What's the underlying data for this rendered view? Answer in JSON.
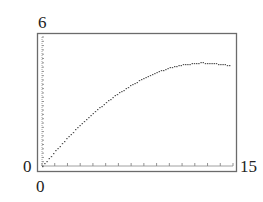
{
  "chart_data": {
    "type": "line",
    "title": "",
    "xlabel": "",
    "ylabel": "",
    "xlim": [
      0,
      15
    ],
    "ylim": [
      0,
      6
    ],
    "grid": false,
    "tick_labels": {
      "y_top": "6",
      "y_bottom": "0",
      "x_left": "0",
      "x_right": "15"
    },
    "x_ticks_count": 15,
    "y_ticks_count": 30,
    "series": [
      {
        "name": "curve",
        "style": "dotted-steps",
        "x": [
          0,
          0.5,
          1,
          1.5,
          2,
          2.5,
          3,
          3.5,
          4,
          4.5,
          5,
          5.5,
          6,
          6.5,
          7,
          7.5,
          8,
          8.5,
          9,
          9.5,
          10,
          10.5,
          11,
          11.5,
          12,
          12.5,
          13,
          13.5,
          14,
          14.5,
          15
        ],
        "values": [
          0,
          0.35,
          0.7,
          1.03,
          1.35,
          1.65,
          1.95,
          2.22,
          2.48,
          2.73,
          2.97,
          3.2,
          3.4,
          3.6,
          3.78,
          3.95,
          4.1,
          4.24,
          4.37,
          4.48,
          4.58,
          4.66,
          4.72,
          4.76,
          4.8,
          4.82,
          4.8,
          4.78,
          4.76,
          4.72,
          4.68
        ]
      }
    ]
  },
  "axis_labels": {
    "y_max": "6",
    "y_min": "0",
    "x_min": "0",
    "x_max": "15"
  },
  "colors": {
    "frame": "#6b6b6b",
    "curve": "#555555",
    "text": "#222222"
  }
}
